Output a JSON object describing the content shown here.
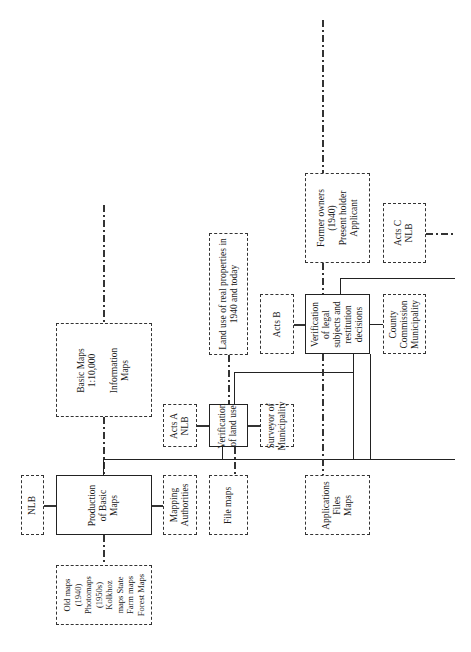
{
  "diagram": {
    "orientation": "rotated 90 degrees counter-clockwise",
    "nodes": [
      {
        "id": "nlb",
        "label": "NLB",
        "style": "dashed"
      },
      {
        "id": "production_basic_maps",
        "label": "Production\nof Basic\nMaps",
        "style": "solid"
      },
      {
        "id": "old_maps",
        "label": "Old maps\n(1940)\nPhotomaps\n(1950s)\nKolkhoz\nmaps State\nFarm maps\nForest Maps",
        "style": "dashed"
      },
      {
        "id": "basic_maps",
        "label": "Basic Maps\n1:10,000\n\nInformation\nMaps",
        "style": "dashed"
      },
      {
        "id": "mapping_authorities",
        "label": "Mapping\nAuthorities",
        "style": "dashed"
      },
      {
        "id": "file_maps",
        "label": "File maps",
        "style": "dashed"
      },
      {
        "id": "acts_a",
        "label": "Acts A\nNLB",
        "style": "dashed"
      },
      {
        "id": "verification_land_use",
        "label": "Verification\nof land use",
        "style": "solid"
      },
      {
        "id": "surveyor",
        "label": "Surveyor of\nMunicipality",
        "style": "dashed"
      },
      {
        "id": "land_use_properties",
        "label": "Land use of real properties in\n1940 and today",
        "style": "dashed"
      },
      {
        "id": "applications",
        "label": "Applications\nFiles\nMaps",
        "style": "dashed"
      },
      {
        "id": "acts_b",
        "label": "Acts B",
        "style": "dashed"
      },
      {
        "id": "verification_legal",
        "label": "Verification\nof legal\nsubjects and\nrestitution\ndecisions",
        "style": "solid"
      },
      {
        "id": "county_commission",
        "label": "County\nCommission\nMunicipality",
        "style": "dashed"
      },
      {
        "id": "former_owners",
        "label": "Former owners\n(1940)\nPresent holder\nApplicant",
        "style": "dashed"
      },
      {
        "id": "acts_c",
        "label": "Acts C\nNLB",
        "style": "dashed"
      }
    ],
    "edges": [
      {
        "from": "nlb",
        "to": "production_basic_maps",
        "style": "dotted"
      },
      {
        "from": "old_maps",
        "to": "production_basic_maps",
        "style": "dash-dot"
      },
      {
        "from": "production_basic_maps",
        "to": "basic_maps",
        "style": "dash-dot"
      },
      {
        "from": "production_basic_maps",
        "to": "mapping_authorities",
        "style": "dotted"
      },
      {
        "from": "production_basic_maps",
        "to": "verification_land_use",
        "style": "solid"
      },
      {
        "from": "acts_a",
        "to": "verification_land_use",
        "style": "dotted"
      },
      {
        "from": "verification_land_use",
        "to": "surveyor",
        "style": "dotted"
      },
      {
        "from": "file_maps",
        "to": "verification_land_use",
        "style": "dash-dot"
      },
      {
        "from": "verification_land_use",
        "to": "land_use_properties",
        "style": "dash-dot"
      },
      {
        "from": "verification_land_use",
        "to": "verification_legal",
        "style": "solid"
      },
      {
        "from": "acts_b",
        "to": "verification_legal",
        "style": "dotted"
      },
      {
        "from": "verification_legal",
        "to": "county_commission",
        "style": "solid"
      },
      {
        "from": "applications",
        "to": "verification_legal",
        "style": "dash-dot"
      },
      {
        "from": "verification_legal",
        "to": "former_owners",
        "style": "dash-dot"
      },
      {
        "from": "acts_c",
        "to": "right_edge",
        "style": "dash-dot"
      }
    ]
  }
}
